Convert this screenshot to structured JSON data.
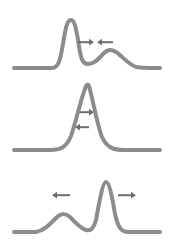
{
  "figure": {
    "width": 174,
    "height": 247,
    "background_color": "#ffffff",
    "wave_color": "#8c8c8c",
    "arrow_color": "#6e6e6e",
    "line_width": 4,
    "panel_count": 3
  },
  "panels": [
    {
      "id": "panel-approach",
      "label": "Two pulses approaching each other",
      "baseline_y": 68,
      "baseline_x_start": 14,
      "baseline_x_end": 160,
      "pulses": [
        {
          "name": "tall-narrow-pulse",
          "center_x": 70,
          "peak_y": 20,
          "amplitude": 48,
          "width": 34,
          "shape": "narrow-tall"
        },
        {
          "name": "broad-low-pulse",
          "center_x": 112,
          "peak_y": 50,
          "amplitude": 18,
          "width": 54,
          "shape": "broad-low"
        }
      ],
      "arrows": [
        {
          "name": "arrow-right",
          "direction": "right",
          "x": 82,
          "y": 42,
          "length": 16
        },
        {
          "name": "arrow-left",
          "direction": "left",
          "x": 104,
          "y": 42,
          "length": 16
        }
      ]
    },
    {
      "id": "panel-overlap",
      "label": "Pulses fully overlapping, constructive superposition",
      "baseline_y": 68,
      "baseline_x_start": 14,
      "baseline_x_end": 160,
      "pulses": [
        {
          "name": "combined-tall-pulse",
          "center_x": 87,
          "peak_y": 4,
          "amplitude": 64,
          "width": 40,
          "shape": "narrow-tall"
        }
      ],
      "arrows": [
        {
          "name": "arrow-right",
          "direction": "right",
          "x": 82,
          "y": 30,
          "length": 14
        },
        {
          "name": "arrow-left",
          "direction": "left",
          "x": 80,
          "y": 45,
          "length": 14
        }
      ]
    },
    {
      "id": "panel-separate",
      "label": "Pulses separating after passing through each other",
      "baseline_y": 68,
      "baseline_x_start": 14,
      "baseline_x_end": 160,
      "pulses": [
        {
          "name": "broad-low-pulse",
          "center_x": 63,
          "peak_y": 50,
          "amplitude": 18,
          "width": 54,
          "shape": "broad-low"
        },
        {
          "name": "tall-narrow-pulse",
          "center_x": 106,
          "peak_y": 18,
          "amplitude": 50,
          "width": 32,
          "shape": "narrow-tall"
        }
      ],
      "arrows": [
        {
          "name": "arrow-left",
          "direction": "left",
          "x": 58,
          "y": 31,
          "length": 18
        },
        {
          "name": "arrow-right",
          "direction": "right",
          "x": 124,
          "y": 31,
          "length": 18
        }
      ]
    }
  ]
}
